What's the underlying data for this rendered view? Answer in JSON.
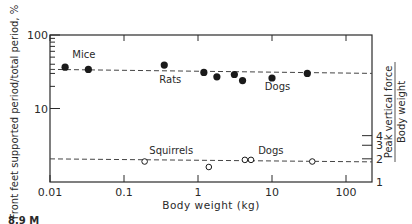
{
  "chart_data": {
    "type": "scatter",
    "title": "",
    "xlabel": "Body weight (kg)",
    "ylabel": "Front feet supported period/total period, %",
    "y2label_numerator": "Peak vertical force",
    "y2label_denominator": "Body weight",
    "xscale": "log",
    "yscale": "log",
    "xlim": [
      0.01,
      300
    ],
    "ylim": [
      1,
      100
    ],
    "grid": false,
    "x_ticks": [
      {
        "value": 0.01,
        "label": "0.01"
      },
      {
        "value": 0.1,
        "label": "0.1"
      },
      {
        "value": 1,
        "label": "1"
      },
      {
        "value": 10,
        "label": "10"
      },
      {
        "value": 100,
        "label": "100"
      }
    ],
    "y_ticks": [
      {
        "value": 100,
        "label": "100"
      },
      {
        "value": 10,
        "label": "10"
      }
    ],
    "y2_ticks": [
      {
        "value": 4,
        "label": "4"
      },
      {
        "value": 3,
        "label": "3"
      },
      {
        "value": 2,
        "label": "2"
      },
      {
        "value": 1,
        "label": "1"
      }
    ],
    "series": [
      {
        "name": "Front feet supported period / total period (%)",
        "marker": "filled-circle",
        "points": [
          {
            "x": 0.016,
            "y": 36.5
          },
          {
            "x": 0.033,
            "y": 34
          },
          {
            "x": 0.35,
            "y": 39
          },
          {
            "x": 1.2,
            "y": 31
          },
          {
            "x": 1.8,
            "y": 27
          },
          {
            "x": 3.1,
            "y": 29
          },
          {
            "x": 4.0,
            "y": 24
          },
          {
            "x": 10,
            "y": 26
          },
          {
            "x": 30,
            "y": 30
          }
        ],
        "fit_line": {
          "y": 33,
          "style": "dashed"
        }
      },
      {
        "name": "Peak vertical force / body weight",
        "marker": "open-circle",
        "axis": "right",
        "points": [
          {
            "x": 0.19,
            "y": 1.9
          },
          {
            "x": 1.4,
            "y": 1.6
          },
          {
            "x": 4.3,
            "y": 2.0
          },
          {
            "x": 5.2,
            "y": 2.0
          },
          {
            "x": 35,
            "y": 1.9
          }
        ],
        "fit_line": {
          "y": 2.0,
          "style": "dashed"
        }
      }
    ],
    "annotations": [
      {
        "text": "Mice",
        "x": 0.02,
        "y": 48
      },
      {
        "text": "Rats",
        "x": 0.3,
        "y": 22
      },
      {
        "text": "Dogs",
        "x": 8,
        "y": 18
      },
      {
        "text": "Squirrels",
        "x": 0.22,
        "y": 2.4
      },
      {
        "text": "Dogs",
        "x": 6.5,
        "y": 2.4
      }
    ],
    "caption_fragment": "8.9 M"
  }
}
